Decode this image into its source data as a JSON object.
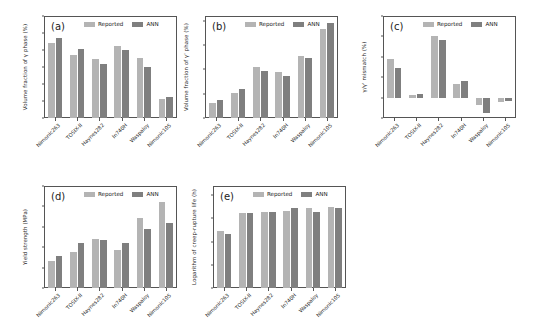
{
  "figure": {
    "series_labels": {
      "reported": "Reported",
      "ann": "ANN"
    },
    "colors": {
      "reported": "#b4b4b4",
      "ann": "#7f7f7f",
      "axis": "#555555",
      "text": "#2a2a2a"
    },
    "categories": [
      "Nimonic263",
      "TOSIX-II",
      "Haynes282",
      "In740H",
      "Waspaloy",
      "Nimonic105"
    ]
  },
  "chart_data": [
    {
      "type": "bar",
      "panel": "(a)",
      "title": "",
      "xlabel": "",
      "ylabel": "Volume fraction of γ phase (%)",
      "ylim": [
        40,
        100
      ],
      "yticks": [
        40,
        50,
        60,
        70,
        80,
        90,
        100
      ],
      "grid": false,
      "legend_position": "upper center",
      "categories": [
        "Nimonic263",
        "TOSIX-II",
        "Haynes282",
        "In740H",
        "Waspaloy",
        "Nimonic105"
      ],
      "series": [
        {
          "name": "Reported",
          "values": [
            84.0,
            77.0,
            74.8,
            82.3,
            75.2,
            51.3
          ]
        },
        {
          "name": "ANN",
          "values": [
            86.8,
            80.8,
            71.5,
            79.8,
            70.0,
            52.2
          ]
        }
      ]
    },
    {
      "type": "bar",
      "panel": "(b)",
      "title": "",
      "xlabel": "",
      "ylabel": "Volume fraction of γ' phase (%)",
      "ylim": [
        0,
        42
      ],
      "yticks": [
        0,
        10,
        20,
        30,
        40
      ],
      "grid": false,
      "legend_position": "upper center",
      "categories": [
        "Nimonic263",
        "TOSIX-II",
        "Haynes282",
        "In740H",
        "Waspaloy",
        "Nimonic105"
      ],
      "series": [
        {
          "name": "Reported",
          "values": [
            6.0,
            10.5,
            20.8,
            19.0,
            25.6,
            36.7
          ]
        },
        {
          "name": "ANN",
          "values": [
            7.6,
            12.0,
            19.2,
            17.2,
            24.7,
            39.0
          ]
        }
      ]
    },
    {
      "type": "bar",
      "panel": "(c)",
      "title": "",
      "xlabel": "",
      "ylabel": "γ/γ' mismatch (%)",
      "ylim": [
        -0.2,
        0.8
      ],
      "yticks": [
        -0.2,
        0.0,
        0.2,
        0.4,
        0.6,
        0.8
      ],
      "grid": false,
      "legend_position": "upper center",
      "categories": [
        "Nimonic263",
        "TOSIX-II",
        "Haynes282",
        "In740H",
        "Waspaloy",
        "Nimonic105"
      ],
      "series": [
        {
          "name": "Reported",
          "values": [
            0.375,
            0.03,
            0.605,
            0.13,
            -0.075,
            -0.04
          ]
        },
        {
          "name": "ANN",
          "values": [
            0.295,
            0.04,
            0.565,
            0.165,
            -0.155,
            -0.03
          ]
        }
      ]
    },
    {
      "type": "bar",
      "panel": "(d)",
      "title": "",
      "xlabel": "",
      "ylabel": "Yield strength (MPa)",
      "ylim": [
        400,
        900
      ],
      "yticks": [
        400,
        500,
        600,
        700,
        800,
        900
      ],
      "grid": false,
      "legend_position": "upper center",
      "categories": [
        "Nimonic263",
        "TOSIX-II",
        "Haynes282",
        "In740H",
        "Waspaloy",
        "Nimonic105"
      ],
      "series": [
        {
          "name": "Reported",
          "values": [
            530,
            578,
            641,
            586,
            744,
            821
          ]
        },
        {
          "name": "ANN",
          "values": [
            555,
            623,
            634,
            620,
            691,
            717
          ]
        }
      ]
    },
    {
      "type": "bar",
      "panel": "(e)",
      "title": "",
      "xlabel": "",
      "ylabel": "Logarithm of creep-rupture life (h)",
      "ylim": [
        10,
        14.4
      ],
      "yticks": [
        10,
        11,
        12,
        13,
        14
      ],
      "grid": false,
      "legend_position": "upper center",
      "categories": [
        "Nimonic263",
        "TOSIX-II",
        "Haynes282",
        "In740H",
        "Waspaloy",
        "Nimonic105"
      ],
      "series": [
        {
          "name": "Reported",
          "values": [
            12.46,
            13.25,
            13.26,
            13.33,
            13.44,
            13.49
          ]
        },
        {
          "name": "ANN",
          "values": [
            12.33,
            13.22,
            13.28,
            13.45,
            13.29,
            13.47
          ]
        }
      ]
    }
  ]
}
